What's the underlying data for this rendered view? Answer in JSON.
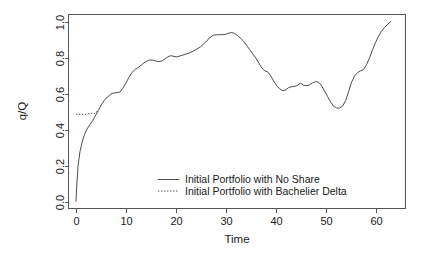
{
  "chart_data": {
    "type": "line",
    "title": "",
    "xlabel": "Time",
    "ylabel": "q/Q",
    "xlim": [
      -1.5,
      66
    ],
    "ylim": [
      -0.035,
      1.04
    ],
    "grid": false,
    "legend_position": "bottom-center",
    "xticks": [
      0,
      10,
      20,
      30,
      40,
      50,
      60
    ],
    "xtick_labels": [
      "0",
      "10",
      "20",
      "30",
      "40",
      "50",
      "60"
    ],
    "yticks": [
      0.0,
      0.2,
      0.4,
      0.6,
      0.8,
      1.0
    ],
    "ytick_labels": [
      "0.0",
      "0.2",
      "0.4",
      "0.6",
      "0.8",
      "1.0"
    ],
    "series": [
      {
        "name": "Initial Portfolio with No Share",
        "style": "solid",
        "color": "#4d4d4d",
        "x": [
          0.0,
          0.15,
          0.4,
          0.8,
          1.2,
          1.7,
          2.2,
          2.8,
          3.4,
          4.0,
          4.6,
          5.2,
          5.8,
          6.4,
          7.0,
          7.6,
          8.2,
          8.8,
          9.4,
          10.0,
          10.6,
          11.2,
          11.8,
          12.4,
          13.0,
          13.6,
          14.2,
          14.8,
          15.4,
          16.0,
          16.6,
          17.2,
          17.8,
          18.4,
          19.0,
          19.6,
          20.2,
          21.0,
          22.0,
          23.0,
          24.0,
          25.0,
          26.0,
          26.8,
          27.5,
          28.3,
          29.2,
          30.0,
          30.6,
          31.2,
          31.8,
          32.4,
          33.0,
          33.6,
          34.2,
          34.8,
          35.4,
          36.0,
          36.6,
          37.2,
          37.8,
          38.4,
          39.0,
          39.6,
          40.2,
          40.8,
          41.4,
          42.0,
          42.6,
          43.2,
          43.8,
          44.4,
          45.0,
          45.6,
          46.2,
          46.8,
          47.4,
          48.0,
          48.6,
          49.2,
          49.8,
          50.4,
          51.0,
          51.6,
          52.2,
          52.8,
          53.4,
          54.0,
          54.6,
          55.2,
          55.8,
          56.4,
          57.0,
          57.6,
          58.2,
          58.8,
          59.4,
          60.0,
          60.6,
          61.2,
          61.8,
          62.4,
          63.0
        ],
        "y": [
          0.005,
          0.09,
          0.2,
          0.28,
          0.33,
          0.375,
          0.405,
          0.43,
          0.455,
          0.485,
          0.515,
          0.545,
          0.57,
          0.585,
          0.6,
          0.605,
          0.607,
          0.61,
          0.632,
          0.66,
          0.692,
          0.718,
          0.735,
          0.745,
          0.758,
          0.772,
          0.782,
          0.788,
          0.787,
          0.782,
          0.779,
          0.782,
          0.793,
          0.805,
          0.812,
          0.808,
          0.805,
          0.812,
          0.82,
          0.83,
          0.845,
          0.862,
          0.888,
          0.912,
          0.925,
          0.928,
          0.928,
          0.93,
          0.937,
          0.94,
          0.935,
          0.922,
          0.908,
          0.89,
          0.868,
          0.845,
          0.822,
          0.8,
          0.772,
          0.745,
          0.728,
          0.722,
          0.7,
          0.672,
          0.645,
          0.628,
          0.618,
          0.622,
          0.635,
          0.64,
          0.642,
          0.648,
          0.66,
          0.648,
          0.645,
          0.65,
          0.662,
          0.668,
          0.665,
          0.645,
          0.615,
          0.585,
          0.555,
          0.532,
          0.522,
          0.522,
          0.532,
          0.562,
          0.612,
          0.665,
          0.7,
          0.718,
          0.728,
          0.735,
          0.762,
          0.8,
          0.845,
          0.885,
          0.92,
          0.948,
          0.968,
          0.985,
          1.0
        ]
      },
      {
        "name": "Initial Portfolio with Bachelier Delta",
        "style": "dotted",
        "color": "#4d4d4d",
        "x": [
          0.0,
          0.5,
          1.0,
          1.5,
          2.0,
          2.4,
          2.8,
          3.2,
          3.6,
          4.0,
          4.4
        ],
        "y": [
          0.488,
          0.487,
          0.486,
          0.486,
          0.487,
          0.49,
          0.493,
          0.492,
          0.49,
          0.495,
          0.512
        ]
      }
    ],
    "legend": [
      {
        "label": "Initial Portfolio with No Share",
        "style": "solid"
      },
      {
        "label": "Initial Portfolio with Bachelier Delta",
        "style": "dotted"
      }
    ]
  }
}
